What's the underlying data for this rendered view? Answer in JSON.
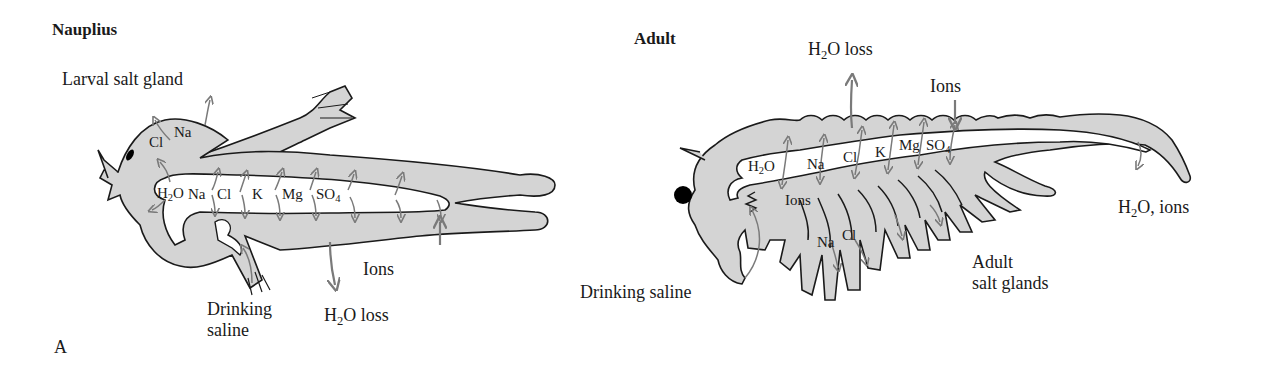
{
  "panel_label": "A",
  "nauplius": {
    "title": "Nauplius",
    "labels": {
      "larval_salt_gland": "Larval salt gland",
      "gland_na": "Na",
      "gland_cl": "Cl",
      "gut_h2o": "H",
      "gut_h2o_sub": "2",
      "gut_h2o_end": "O",
      "gut_na": "Na",
      "gut_cl": "Cl",
      "gut_k": "K",
      "gut_mg": "Mg",
      "gut_so4": "SO",
      "gut_so4_sub": "4",
      "ions": "Ions",
      "drinking_line1": "Drinking",
      "drinking_line2": "saline",
      "h2o_loss": "H",
      "h2o_loss_sub": "2",
      "h2o_loss_end": "O loss"
    }
  },
  "adult": {
    "title": "Adult",
    "labels": {
      "h2o_loss": "H",
      "h2o_loss_sub": "2",
      "h2o_loss_end": "O loss",
      "ions_top": "Ions",
      "gut_h2o": "H",
      "gut_h2o_sub": "2",
      "gut_h2o_end": "O",
      "gut_na": "Na",
      "gut_cl": "Cl",
      "gut_k": "K",
      "gut_mg": "Mg",
      "gut_so4": "SO",
      "gut_so4_sub": "4",
      "ions_inner": "Ions",
      "leg_na": "Na",
      "leg_cl": "Cl",
      "h2o_ions": "H",
      "h2o_ions_sub": "2",
      "h2o_ions_end": "O, ions",
      "salt_glands_line1": "Adult",
      "salt_glands_line2": "salt glands",
      "drinking": "Drinking saline"
    }
  },
  "colors": {
    "body_fill": "#d4d4d4",
    "outline": "#1a1a1a",
    "arrow": "#7a7a7a",
    "eye": "#000000"
  }
}
